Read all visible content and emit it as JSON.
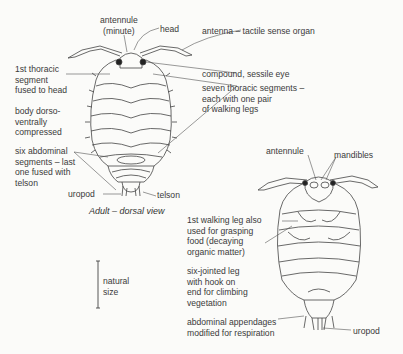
{
  "dorsal_view": {
    "caption": "Adult – dorsal view",
    "labels": {
      "antennule": [
        "antennule",
        "(minute)"
      ],
      "head": "head",
      "antenna": "antenna – tactile sense organ",
      "first_thoracic": [
        "1st thoracic",
        "segment",
        "fused to head"
      ],
      "eye": "compound, sessile eye",
      "thoracic_segments": [
        "seven thoracic segments –",
        "each with one pair",
        "of walking legs"
      ],
      "body": [
        "body dorso-",
        "ventrally",
        "compressed"
      ],
      "abdominal": [
        "six abdominal",
        "segments – last",
        "one fused with",
        "telson"
      ],
      "uropod": "uropod",
      "telson": "telson"
    }
  },
  "ventral_view": {
    "labels": {
      "antennule": "antennule",
      "mandibles": "mandibles",
      "first_leg": [
        "1st walking leg also",
        "used for grasping",
        "food (decaying",
        "organic matter)"
      ],
      "six_jointed": [
        "six-jointed leg",
        "with hook on",
        "end for climbing",
        "vegetation"
      ],
      "abdominal_appendages": [
        "abdominal appendages",
        "modified for respiration"
      ],
      "uropod": "uropod"
    }
  },
  "scale": {
    "label": [
      "natural",
      "size"
    ]
  }
}
